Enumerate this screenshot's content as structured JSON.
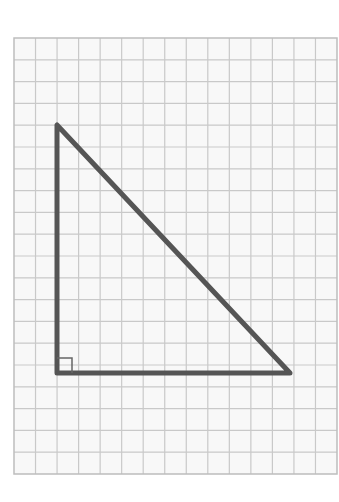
{
  "diagram": {
    "type": "right-triangle-on-grid-paper",
    "grid": {
      "left": 14,
      "top": 38,
      "right": 337,
      "bottom": 474,
      "cell_size": 21.6,
      "columns": 15,
      "rows": 20,
      "line_color": "#c9c9c9",
      "paper_color": "#f8f8f8",
      "border_color": "#bdbdbd"
    },
    "triangle": {
      "vertices": [
        {
          "name": "top",
          "x": 57,
          "y": 125
        },
        {
          "name": "right-angle",
          "x": 57,
          "y": 373
        },
        {
          "name": "bottom-right",
          "x": 290,
          "y": 373
        }
      ],
      "stroke_color": "#555555",
      "stroke_width": 5,
      "right_angle_marker": {
        "x": 57,
        "y": 358,
        "size": 15,
        "stroke_color": "#666666"
      }
    }
  }
}
